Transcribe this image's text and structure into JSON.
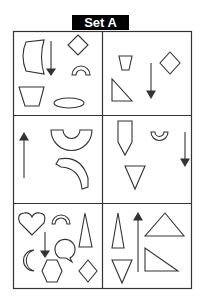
{
  "title": "Set A",
  "grid": {
    "rows": 3,
    "cols": 2,
    "cells": [
      {
        "id": "r1c1",
        "shapes": [
          "curved-rectangle",
          "diamond",
          "arrow-down",
          "semicircle-arch",
          "trapezoid",
          "ellipse"
        ]
      },
      {
        "id": "r1c2",
        "shapes": [
          "small-trapezoid",
          "diamond",
          "right-triangle",
          "arrow-down"
        ]
      },
      {
        "id": "r2c1",
        "shapes": [
          "arrow-up",
          "semicircle-cup",
          "curved-arc-segment"
        ]
      },
      {
        "id": "r2c2",
        "shapes": [
          "pentagon-arrow",
          "small-cup",
          "arrow-down",
          "inverted-triangle"
        ]
      },
      {
        "id": "r3c1",
        "shapes": [
          "heart",
          "arch",
          "tall-triangle",
          "arrow-down",
          "speech-bubble",
          "crescent",
          "hexagon",
          "diamond"
        ]
      },
      {
        "id": "r3c2",
        "shapes": [
          "tall-triangle",
          "arrow-up",
          "triangle",
          "inverted-triangle",
          "right-triangle"
        ]
      }
    ]
  },
  "colors": {
    "stroke": "#333333",
    "badge_bg": "#000000",
    "badge_text": "#ffffff"
  }
}
